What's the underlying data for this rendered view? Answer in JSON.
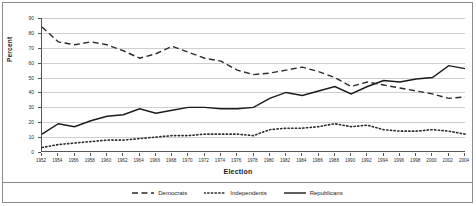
{
  "figure": {
    "y_axis_title": "Percent",
    "x_axis_title": "Election"
  },
  "chart_data": {
    "type": "line",
    "title": "",
    "xlabel": "Election",
    "ylabel": "Percent",
    "xlim": [
      1952,
      2004
    ],
    "ylim": [
      0,
      90
    ],
    "ytick_step": 10,
    "grid": true,
    "legend_position": "bottom",
    "categories": [
      "1952",
      "1954",
      "1956",
      "1958",
      "1960",
      "1962",
      "1964",
      "1966",
      "1968",
      "1970",
      "1972",
      "1974",
      "1976",
      "1978",
      "1980",
      "1982",
      "1984",
      "1986",
      "1988",
      "1990",
      "1992",
      "1994",
      "1996",
      "1998",
      "2000",
      "2002",
      "2004"
    ],
    "ytick_labels": [
      "0",
      "10",
      "20",
      "30",
      "40",
      "50",
      "60",
      "70",
      "80",
      "90"
    ],
    "series": [
      {
        "name": "Democrats",
        "style": "dashed",
        "color": "#2b2b2b",
        "values": [
          84,
          74,
          72,
          74,
          72,
          68,
          63,
          66,
          71,
          67,
          63,
          61,
          55,
          52,
          53,
          55,
          57,
          54,
          50,
          44,
          47,
          45,
          43,
          41,
          39,
          36,
          37
        ]
      },
      {
        "name": "Independents",
        "style": "dotted",
        "color": "#2b2b2b",
        "values": [
          3,
          5,
          6,
          7,
          8,
          8,
          9,
          10,
          11,
          11,
          12,
          12,
          12,
          11,
          15,
          16,
          16,
          17,
          19,
          17,
          18,
          15,
          14,
          14,
          15,
          14,
          12
        ]
      },
      {
        "name": "Republicans",
        "style": "solid",
        "color": "#1a1a1a",
        "values": [
          12,
          19,
          17,
          21,
          24,
          25,
          29,
          26,
          28,
          30,
          30,
          29,
          29,
          30,
          36,
          40,
          38,
          41,
          44,
          39,
          44,
          48,
          47,
          49,
          50,
          58,
          56
        ]
      }
    ]
  },
  "legend": {
    "items": [
      {
        "label": "Democrats",
        "swatch": "dashed-line-swatch"
      },
      {
        "label": "Independents",
        "swatch": "dotted-line-swatch"
      },
      {
        "label": "Republicans",
        "swatch": "solid-line-swatch"
      }
    ]
  }
}
